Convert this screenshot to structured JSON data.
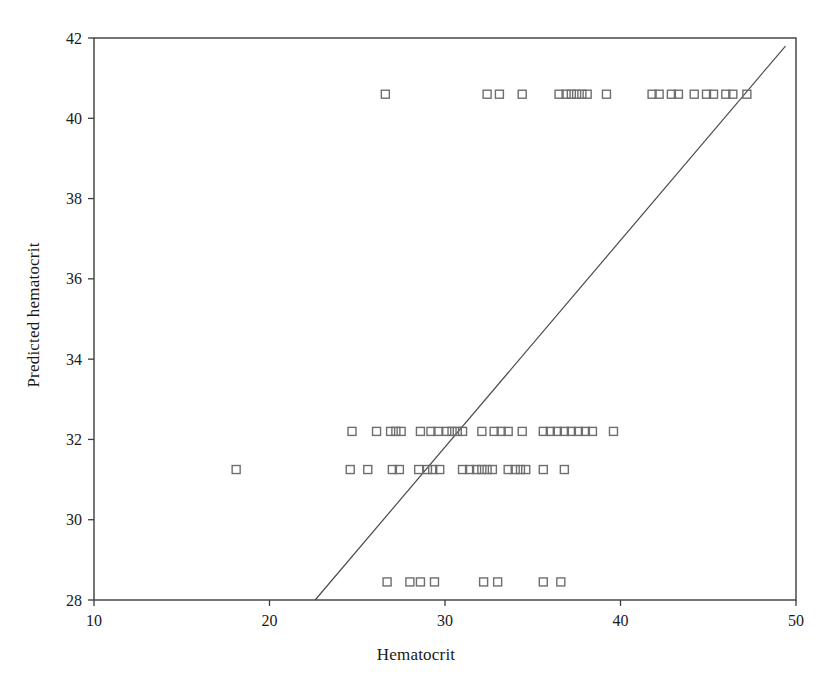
{
  "figure": {
    "background": "#ffffff",
    "frame_color": "#3c3c3c",
    "marker_color": "#6e6e6e",
    "line_color": "#4a4a4a"
  },
  "chart_data": {
    "type": "scatter",
    "title": "",
    "xlabel": "Hematocrit",
    "ylabel": "Predicted hematocrit",
    "xlim": [
      10,
      50
    ],
    "ylim": [
      28,
      42
    ],
    "xticks": [
      10,
      20,
      30,
      40,
      50
    ],
    "yticks": [
      28,
      30,
      32,
      34,
      36,
      38,
      40,
      42
    ],
    "xtick_labels": [
      "10",
      "20",
      "30",
      "40",
      "50"
    ],
    "ytick_labels": [
      "28",
      "30",
      "32",
      "34",
      "36",
      "38",
      "40",
      "42"
    ],
    "grid": false,
    "legend": null,
    "marker": "open-square",
    "marker_size": 8,
    "series": [
      {
        "name": "Predicted vs observed hematocrit",
        "points": [
          [
            26.6,
            40.6
          ],
          [
            32.4,
            40.6
          ],
          [
            33.1,
            40.6
          ],
          [
            34.4,
            40.6
          ],
          [
            36.5,
            40.6
          ],
          [
            36.9,
            40.6
          ],
          [
            37.2,
            40.6
          ],
          [
            37.5,
            40.6
          ],
          [
            37.8,
            40.6
          ],
          [
            38.1,
            40.6
          ],
          [
            39.2,
            40.6
          ],
          [
            41.8,
            40.6
          ],
          [
            42.2,
            40.6
          ],
          [
            42.9,
            40.6
          ],
          [
            43.3,
            40.6
          ],
          [
            44.2,
            40.6
          ],
          [
            44.9,
            40.6
          ],
          [
            45.3,
            40.6
          ],
          [
            46.0,
            40.6
          ],
          [
            46.4,
            40.6
          ],
          [
            47.2,
            40.6
          ],
          [
            24.7,
            32.2
          ],
          [
            26.1,
            32.2
          ],
          [
            26.9,
            32.2
          ],
          [
            27.2,
            32.2
          ],
          [
            27.5,
            32.2
          ],
          [
            28.6,
            32.2
          ],
          [
            29.2,
            32.2
          ],
          [
            29.6,
            32.2
          ],
          [
            30.1,
            32.2
          ],
          [
            30.4,
            32.2
          ],
          [
            30.7,
            32.2
          ],
          [
            31.0,
            32.2
          ],
          [
            32.1,
            32.2
          ],
          [
            32.8,
            32.2
          ],
          [
            33.2,
            32.2
          ],
          [
            33.6,
            32.2
          ],
          [
            34.4,
            32.2
          ],
          [
            35.6,
            32.2
          ],
          [
            36.0,
            32.2
          ],
          [
            36.4,
            32.2
          ],
          [
            36.8,
            32.2
          ],
          [
            37.2,
            32.2
          ],
          [
            37.6,
            32.2
          ],
          [
            38.0,
            32.2
          ],
          [
            38.4,
            32.2
          ],
          [
            39.6,
            32.2
          ],
          [
            18.1,
            31.25
          ],
          [
            24.6,
            31.25
          ],
          [
            25.6,
            31.25
          ],
          [
            27.0,
            31.25
          ],
          [
            27.4,
            31.25
          ],
          [
            28.5,
            31.25
          ],
          [
            29.0,
            31.25
          ],
          [
            29.3,
            31.25
          ],
          [
            29.7,
            31.25
          ],
          [
            31.0,
            31.25
          ],
          [
            31.4,
            31.25
          ],
          [
            31.8,
            31.25
          ],
          [
            32.1,
            31.25
          ],
          [
            32.4,
            31.25
          ],
          [
            32.7,
            31.25
          ],
          [
            33.6,
            31.25
          ],
          [
            34.0,
            31.25
          ],
          [
            34.3,
            31.25
          ],
          [
            34.6,
            31.25
          ],
          [
            35.6,
            31.25
          ],
          [
            36.8,
            31.25
          ],
          [
            26.7,
            28.45
          ],
          [
            28.0,
            28.45
          ],
          [
            28.6,
            28.45
          ],
          [
            29.4,
            28.45
          ],
          [
            32.2,
            28.45
          ],
          [
            33.0,
            28.45
          ],
          [
            35.6,
            28.45
          ],
          [
            36.6,
            28.45
          ]
        ]
      }
    ],
    "reference_line": {
      "name": "identity-reference-line",
      "x_start": 22.6,
      "y_start": 28.0,
      "x_end": 49.4,
      "y_end": 41.8
    }
  }
}
